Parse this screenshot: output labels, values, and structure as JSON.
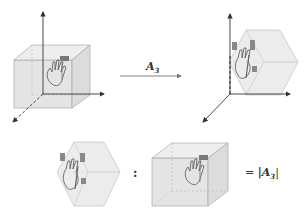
{
  "diagram": {
    "transform_arrow": {
      "label": "A",
      "subscript": "3"
    },
    "equation": {
      "ratio_symbol": ":",
      "equals": "=",
      "result_label": "|A",
      "result_subscript": "3",
      "result_close": "|"
    },
    "panels": [
      {
        "name": "original-cube",
        "description": "Unit cube with hand glyph on 3D axes"
      },
      {
        "name": "transformed-cube",
        "description": "Sheared/rotated parallelepiped with hand glyph on 3D axes"
      },
      {
        "name": "transformed-volume",
        "description": "Transformed parallelepiped alone"
      },
      {
        "name": "original-volume",
        "description": "Original cube alone"
      }
    ],
    "colors": {
      "cube_fill": "#e6e6e6",
      "cube_edge": "#b0b0b0",
      "axis": "#333333",
      "hand": "#555555",
      "hand_block": "#777777"
    }
  }
}
